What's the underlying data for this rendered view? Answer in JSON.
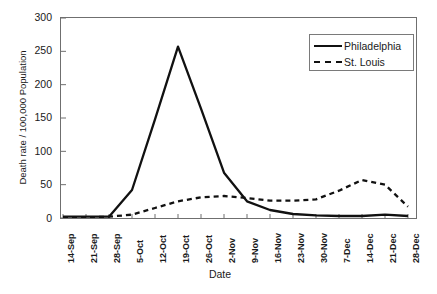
{
  "chart_data": {
    "type": "line",
    "title": "",
    "xlabel": "Date",
    "ylabel": "Death rate / 100,000 Population",
    "ylim": [
      0,
      300
    ],
    "yticks": [
      0,
      50,
      100,
      150,
      200,
      250,
      300
    ],
    "grid": false,
    "legend_position": "top-right",
    "categories": [
      "14-Sep",
      "21-Sep",
      "28-Sep",
      "5-Oct",
      "12-Oct",
      "19-Oct",
      "26-Oct",
      "2-Nov",
      "9-Nov",
      "16-Nov",
      "23-Nov",
      "30-Nov",
      "7-Dec",
      "14-Dec",
      "21-Dec",
      "28-Dec"
    ],
    "series": [
      {
        "name": "Philadelphia",
        "style": "solid",
        "color": "#111111",
        "values": [
          2,
          2,
          2,
          42,
          148,
          257,
          164,
          68,
          25,
          12,
          6,
          4,
          3,
          3,
          5,
          3
        ]
      },
      {
        "name": "St. Louis",
        "style": "dashed",
        "color": "#111111",
        "values": [
          1,
          1,
          2,
          5,
          15,
          25,
          31,
          33,
          30,
          26,
          26,
          28,
          41,
          57,
          50,
          17
        ]
      }
    ]
  },
  "axis": {
    "ytick_labels": [
      "300",
      "250",
      "200",
      "150",
      "100",
      "50",
      "0"
    ],
    "xlabel_text": "Date",
    "ylabel_text": "Death rate / 100,000 Population"
  },
  "legend": {
    "items": [
      {
        "label": "Philadelphia",
        "style": "solid"
      },
      {
        "label": "St. Louis",
        "style": "dashed"
      }
    ]
  }
}
